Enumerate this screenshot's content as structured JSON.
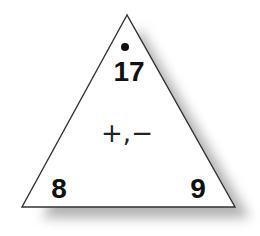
{
  "fact_triangle": {
    "top": "17",
    "bottom_left": "8",
    "bottom_right": "9",
    "operations": "+,−",
    "marker": "dot"
  },
  "colors": {
    "outline": "#333333",
    "fill": "#ffffff",
    "text": "#111111",
    "shadow": "#9a9a9a"
  }
}
